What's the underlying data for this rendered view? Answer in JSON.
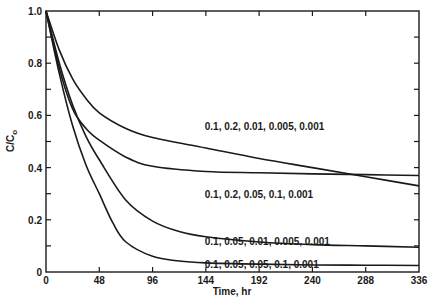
{
  "chart_data": {
    "type": "line",
    "title": "",
    "xlabel": "Time, hr",
    "ylabel": "C/C0",
    "xlim": [
      0,
      336
    ],
    "ylim": [
      0,
      1.0
    ],
    "x_ticks": [
      0,
      48,
      96,
      144,
      192,
      240,
      288,
      336
    ],
    "x_tick_labels": [
      "0",
      "48",
      "96",
      "144",
      "192",
      "240",
      "288",
      "336"
    ],
    "y_ticks": [
      0,
      0.1,
      0.2,
      0.3,
      0.4,
      0.5,
      0.6,
      0.7,
      0.8,
      0.9,
      1.0
    ],
    "y_tick_labels": [
      "0",
      "",
      "0.2",
      "",
      "0.4",
      "",
      "0.6",
      "",
      "0.8",
      "",
      "1.0"
    ],
    "grid": false,
    "legend_position": "inline labels",
    "series": [
      {
        "name": "0.1, 0.2, 0.01, 0.005, 0.001",
        "x": [
          0,
          12,
          24,
          36,
          48,
          72,
          96,
          144,
          192,
          240,
          288,
          336
        ],
        "values": [
          1.0,
          0.85,
          0.74,
          0.665,
          0.61,
          0.55,
          0.515,
          0.475,
          0.435,
          0.4,
          0.365,
          0.33
        ],
        "label_pos": {
          "x": 143,
          "y": 0.56
        }
      },
      {
        "name": "0.1, 0.2, 0.05, 0.1, 0.001",
        "x": [
          0,
          12,
          24,
          36,
          48,
          72,
          96,
          144,
          192,
          240,
          288,
          336
        ],
        "values": [
          1.0,
          0.78,
          0.625,
          0.55,
          0.505,
          0.44,
          0.405,
          0.385,
          0.38,
          0.376,
          0.373,
          0.37
        ],
        "label_pos": {
          "x": 143,
          "y": 0.3
        }
      },
      {
        "name": "0.1, 0.05, 0.01, 0.005, 0.001",
        "x": [
          0,
          12,
          24,
          36,
          48,
          72,
          96,
          120,
          144,
          192,
          240,
          288,
          336
        ],
        "values": [
          1.0,
          0.8,
          0.64,
          0.52,
          0.43,
          0.275,
          0.195,
          0.155,
          0.135,
          0.115,
          0.105,
          0.1,
          0.095
        ],
        "label_pos": {
          "x": 143,
          "y": 0.12
        }
      },
      {
        "name": "0.1, 0.05, 0.05, 0.1, 0.001",
        "x": [
          0,
          12,
          24,
          36,
          48,
          60,
          72,
          96,
          120,
          144,
          192,
          240,
          288,
          336
        ],
        "values": [
          1.0,
          0.76,
          0.56,
          0.41,
          0.3,
          0.19,
          0.115,
          0.06,
          0.042,
          0.035,
          0.03,
          0.027,
          0.026,
          0.025
        ],
        "label_pos": {
          "x": 143,
          "y": 0.03
        }
      }
    ],
    "annotations": [
      "curves cross near t≈260 hr at C/C0≈0.375"
    ]
  }
}
